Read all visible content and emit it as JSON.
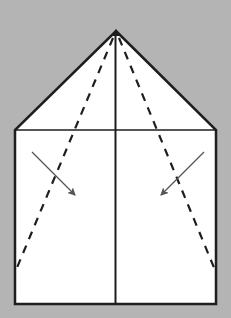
{
  "diagram": {
    "type": "origami-fold-step",
    "colors": {
      "background": "#b4b4b4",
      "paper": "#ffffff",
      "edge": "#1e1e1e",
      "arrow": "#555555"
    },
    "shape": {
      "apex": [
        116,
        31
      ],
      "left_shoulder": [
        15,
        130
      ],
      "right_shoulder": [
        216,
        130
      ],
      "bottom_left": [
        15,
        304
      ],
      "bottom_right": [
        216,
        304
      ]
    },
    "center_crease": {
      "x": 115,
      "y1": 31,
      "y2": 304
    },
    "horizontal_edge": {
      "y": 130,
      "x1": 15,
      "x2": 216
    },
    "fold_lines": [
      {
        "name": "left-valley-fold",
        "from": [
          116,
          31
        ],
        "to": [
          16,
          270
        ],
        "style": "dashed"
      },
      {
        "name": "right-valley-fold",
        "from": [
          116,
          31
        ],
        "to": [
          215,
          270
        ],
        "style": "dashed"
      }
    ],
    "arrows": [
      {
        "name": "left-fold-arrow",
        "from": [
          32,
          152
        ],
        "to": [
          76,
          196
        ]
      },
      {
        "name": "right-fold-arrow",
        "from": [
          204,
          152
        ],
        "to": [
          160,
          196
        ]
      }
    ]
  }
}
